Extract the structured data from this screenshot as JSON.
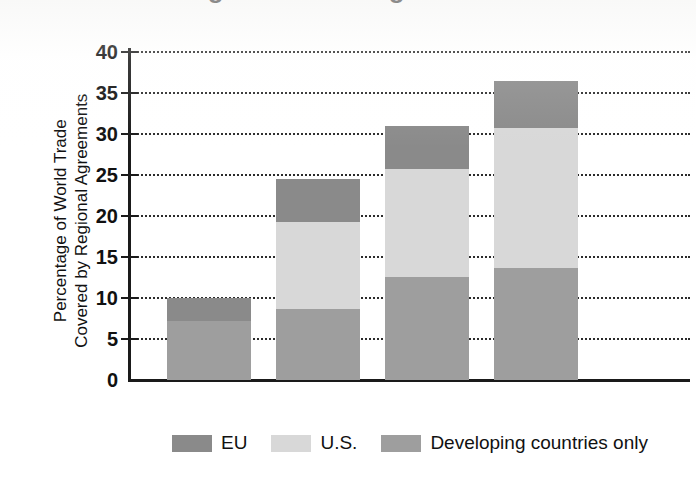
{
  "figure": {
    "title_partial": "Regional Trade Agreements",
    "background_color": "#ffffff"
  },
  "chart_data": {
    "type": "bar",
    "subtype": "stacked-bar",
    "title": "",
    "xlabel": "",
    "ylabel": "Percentage of World Trade Covered by Regional Agreements",
    "ylabel_lines": [
      "Percentage of World Trade",
      "Covered by Regional Agreements"
    ],
    "categories": [
      "1990",
      "1996",
      "2002",
      "2011"
    ],
    "ylim": [
      0,
      40
    ],
    "yticks": [
      0,
      5,
      10,
      15,
      20,
      25,
      30,
      35,
      40
    ],
    "ytick_labels": [
      "0",
      "5",
      "10",
      "15",
      "20",
      "25",
      "30",
      "35",
      "40"
    ],
    "grid": true,
    "grid_style": "dotted",
    "grid_axis": "y",
    "legend_position": "bottom",
    "stack_order_bottom_to_top": [
      "Developing countries only",
      "U.S.",
      "EU"
    ],
    "series": [
      {
        "name": "Developing countries only",
        "color": "#9e9e9e",
        "values": [
          7.2,
          8.7,
          12.6,
          13.6
        ]
      },
      {
        "name": "U.S.",
        "color": "#d8d8d8",
        "values": [
          0.0,
          10.6,
          13.1,
          17.1
        ]
      },
      {
        "name": "EU",
        "color": "#8a8a8a",
        "values": [
          2.8,
          5.2,
          5.3,
          5.8
        ]
      }
    ],
    "totals": [
      10.0,
      24.5,
      31.0,
      36.5
    ]
  },
  "legend": {
    "items": [
      {
        "label": "EU",
        "color": "#8a8a8a"
      },
      {
        "label": "U.S.",
        "color": "#d8d8d8"
      },
      {
        "label": "Developing countries only",
        "color": "#9e9e9e"
      }
    ]
  },
  "axis": {
    "axis_color": "#1a1a1a",
    "grid_color": "#2b2b2b"
  }
}
